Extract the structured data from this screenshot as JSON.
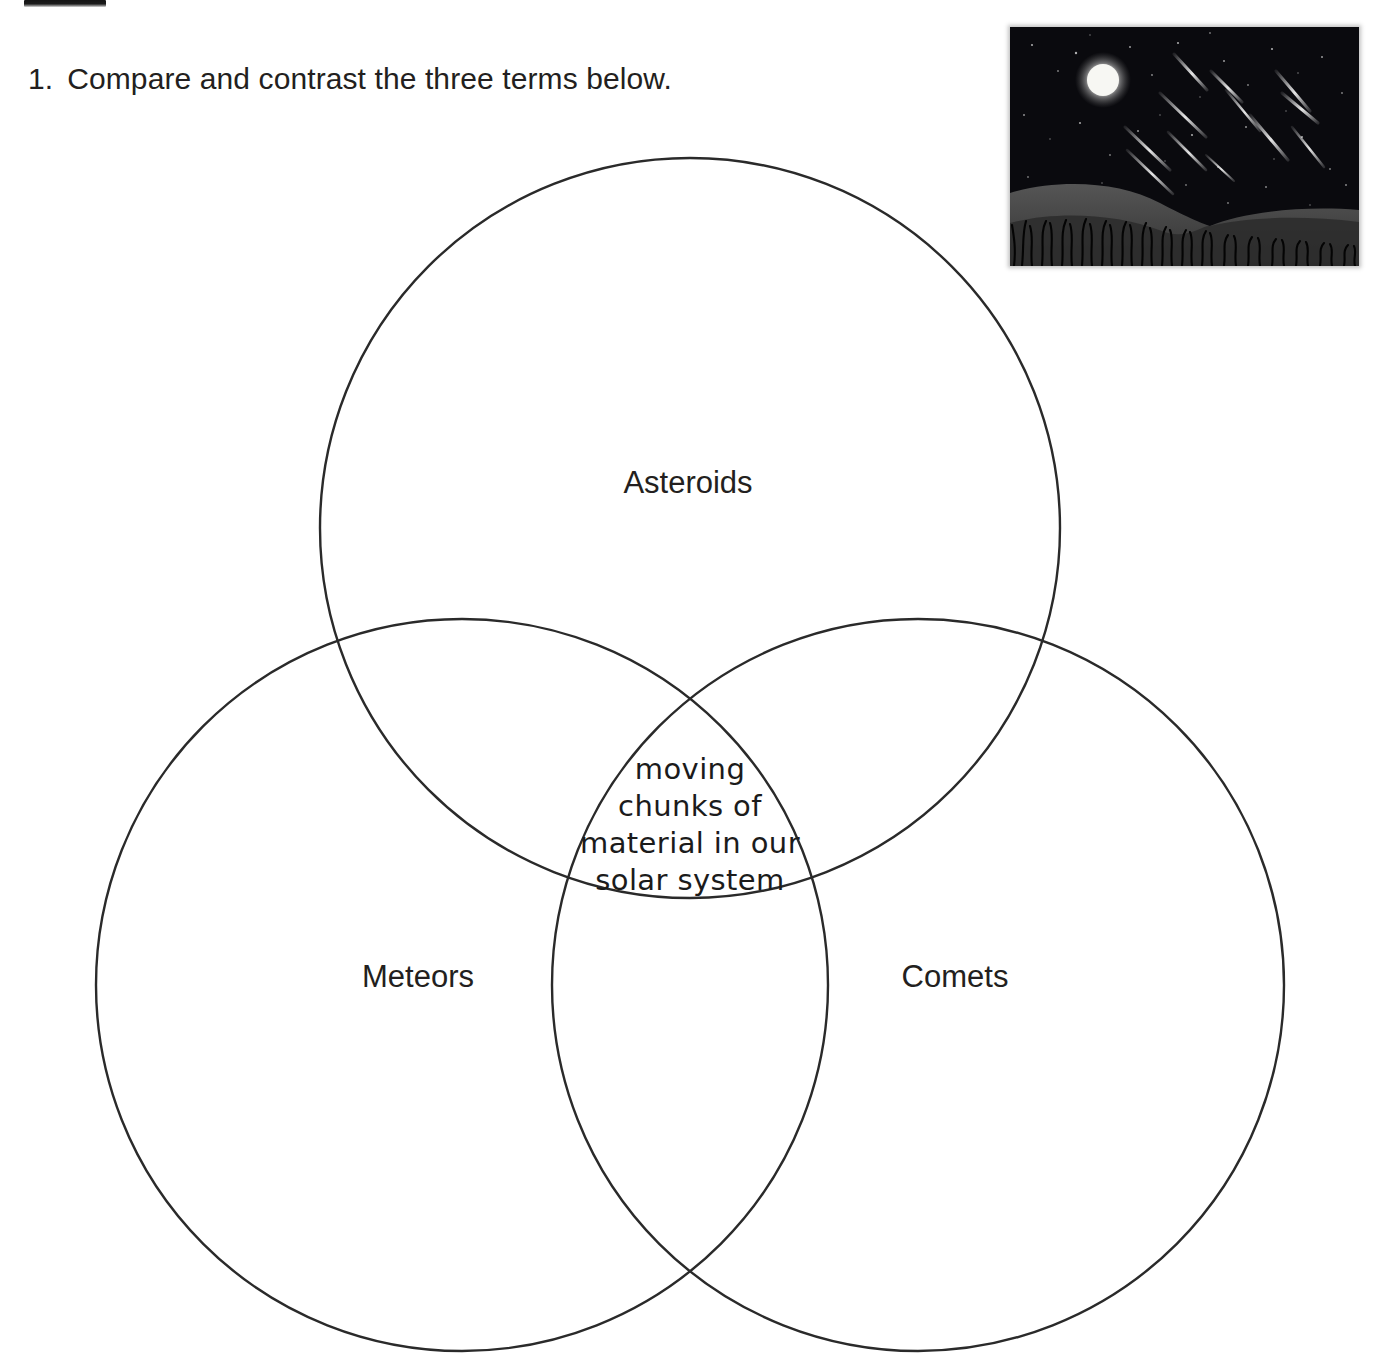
{
  "page": {
    "width": 1373,
    "height": 1372,
    "background": "#ffffff",
    "ink_color": "#231f20"
  },
  "question": {
    "number": "1.",
    "text": "Compare and contrast the three terms below."
  },
  "photo": {
    "name": "meteor-shower-night-sky-photo",
    "description": "Night sky with full moon, stars, meteor streaks, dark hills and grass silhouette",
    "colors": {
      "sky": "#0b0b10",
      "moon": "#f2f2ef",
      "hill": "#4a4a4a",
      "grass": "#050505",
      "meteor": "#e8e8e8"
    }
  },
  "venn": {
    "stroke": "#2a2a2a",
    "stroke_width": 2.4,
    "fill": "none",
    "circles": [
      {
        "id": "asteroids",
        "label": "Asteroids",
        "cx": 690,
        "cy": 528,
        "r": 370,
        "label_x": 688,
        "label_y": 483
      },
      {
        "id": "meteors",
        "label": "Meteors",
        "cx": 462,
        "cy": 985,
        "r": 366,
        "label_x": 418,
        "label_y": 977
      },
      {
        "id": "comets",
        "label": "Comets",
        "cx": 918,
        "cy": 985,
        "r": 366,
        "label_x": 955,
        "label_y": 977
      }
    ],
    "center_answer": {
      "full_text": "moving chunks of material in our solar system",
      "lines": [
        "moving",
        "chunks of",
        "material in our",
        "solar system"
      ]
    }
  }
}
